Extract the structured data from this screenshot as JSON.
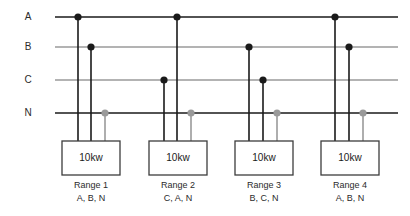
{
  "diagram": {
    "colors": {
      "black": "#1a1a1a",
      "gray": "#9a9a9a",
      "box_border": "#3c3c3c",
      "background": "#ffffff",
      "text": "#2b2b2b"
    },
    "buses": [
      {
        "id": "A",
        "label": "A",
        "y": 17,
        "color": "#1a1a1a",
        "x_start": 55,
        "x_end": 398
      },
      {
        "id": "B",
        "label": "B",
        "y": 47,
        "color": "#9a9a9a",
        "x_start": 55,
        "x_end": 398
      },
      {
        "id": "C",
        "label": "C",
        "y": 80,
        "color": "#9a9a9a",
        "x_start": 55,
        "x_end": 398
      },
      {
        "id": "N",
        "label": "N",
        "y": 113,
        "color": "#1a1a1a",
        "x_start": 55,
        "x_end": 398
      }
    ],
    "bus_label_x": 28,
    "ranges": [
      {
        "name": "Range 1",
        "phases": "A, B, N",
        "load": "10kw",
        "box": {
          "x": 62,
          "y": 141,
          "width": 58,
          "height": 34
        },
        "caption_y1": 186,
        "caption_y2": 199,
        "drops": [
          {
            "bus": "A",
            "x": 78,
            "y": 17,
            "color": "#1a1a1a",
            "dot": "black"
          },
          {
            "bus": "B",
            "x": 91,
            "y": 47,
            "color": "#1a1a1a",
            "dot": "black"
          },
          {
            "bus": "N",
            "x": 105,
            "y": 113,
            "color": "#9a9a9a",
            "dot": "gray"
          }
        ]
      },
      {
        "name": "Range 2",
        "phases": "C, A, N",
        "load": "10kw",
        "box": {
          "x": 149,
          "y": 141,
          "width": 58,
          "height": 34
        },
        "caption_y1": 186,
        "caption_y2": 199,
        "drops": [
          {
            "bus": "C",
            "x": 164,
            "y": 80,
            "color": "#1a1a1a",
            "dot": "black"
          },
          {
            "bus": "A",
            "x": 177,
            "y": 17,
            "color": "#1a1a1a",
            "dot": "black"
          },
          {
            "bus": "N",
            "x": 191,
            "y": 113,
            "color": "#9a9a9a",
            "dot": "gray"
          }
        ]
      },
      {
        "name": "Range 3",
        "phases": "B, C, N",
        "load": "10kw",
        "box": {
          "x": 235,
          "y": 141,
          "width": 58,
          "height": 34
        },
        "caption_y1": 186,
        "caption_y2": 199,
        "drops": [
          {
            "bus": "B",
            "x": 249,
            "y": 47,
            "color": "#1a1a1a",
            "dot": "black"
          },
          {
            "bus": "C",
            "x": 263,
            "y": 80,
            "color": "#1a1a1a",
            "dot": "black"
          },
          {
            "bus": "N",
            "x": 277,
            "y": 113,
            "color": "#9a9a9a",
            "dot": "gray"
          }
        ]
      },
      {
        "name": "Range 4",
        "phases": "A, B, N",
        "load": "10kw",
        "box": {
          "x": 321,
          "y": 141,
          "width": 58,
          "height": 34
        },
        "caption_y1": 186,
        "caption_y2": 199,
        "drops": [
          {
            "bus": "A",
            "x": 335,
            "y": 17,
            "color": "#1a1a1a",
            "dot": "black"
          },
          {
            "bus": "B",
            "x": 349,
            "y": 47,
            "color": "#1a1a1a",
            "dot": "black"
          },
          {
            "bus": "N",
            "x": 363,
            "y": 113,
            "color": "#9a9a9a",
            "dot": "gray"
          }
        ]
      }
    ]
  }
}
